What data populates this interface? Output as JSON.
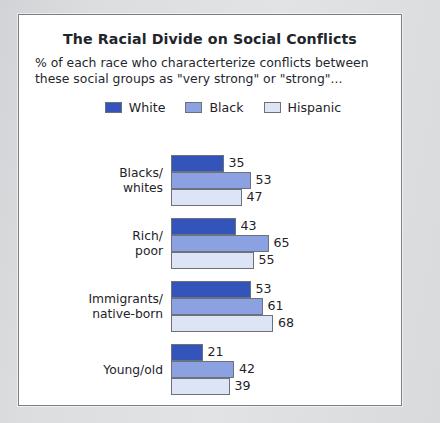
{
  "chart_data": {
    "type": "bar",
    "orientation": "horizontal",
    "title": "The Racial Divide on Social Conflicts",
    "subtitle": "% of each race who characterterize conflicts between these social groups as \"very strong\" or \"strong\"...",
    "xlabel": "",
    "ylabel": "",
    "xlim": [
      0,
      70
    ],
    "grid": false,
    "legend_position": "top-center",
    "categories": [
      "Blacks/\nwhites",
      "Rich/\npoor",
      "Immigrants/\nnative-born",
      "Young/old"
    ],
    "series": [
      {
        "name": "White",
        "color": "#3355bb",
        "values": [
          35,
          43,
          53,
          21
        ]
      },
      {
        "name": "Black",
        "color": "#8ba1e2",
        "values": [
          53,
          65,
          61,
          42
        ]
      },
      {
        "name": "Hispanic",
        "color": "#dde4f5",
        "values": [
          47,
          55,
          68,
          39
        ]
      }
    ]
  },
  "legend": {
    "items": [
      {
        "label": "White",
        "color": "#3355bb"
      },
      {
        "label": "Black",
        "color": "#8ba1e2"
      },
      {
        "label": "Hispanic",
        "color": "#dde4f5"
      }
    ]
  },
  "groups": [
    {
      "label": "Blacks/\nwhites",
      "bars": [
        {
          "series": "White",
          "value": 35,
          "value_text": "35",
          "color": "#3355bb"
        },
        {
          "series": "Black",
          "value": 53,
          "value_text": "53",
          "color": "#8ba1e2"
        },
        {
          "series": "Hispanic",
          "value": 47,
          "value_text": "47",
          "color": "#dde4f5"
        }
      ]
    },
    {
      "label": "Rich/\npoor",
      "bars": [
        {
          "series": "White",
          "value": 43,
          "value_text": "43",
          "color": "#3355bb"
        },
        {
          "series": "Black",
          "value": 65,
          "value_text": "65",
          "color": "#8ba1e2"
        },
        {
          "series": "Hispanic",
          "value": 55,
          "value_text": "55",
          "color": "#dde4f5"
        }
      ]
    },
    {
      "label": "Immigrants/\nnative-born",
      "bars": [
        {
          "series": "White",
          "value": 53,
          "value_text": "53",
          "color": "#3355bb"
        },
        {
          "series": "Black",
          "value": 61,
          "value_text": "61",
          "color": "#8ba1e2"
        },
        {
          "series": "Hispanic",
          "value": 68,
          "value_text": "68",
          "color": "#dde4f5"
        }
      ]
    },
    {
      "label": "Young/old",
      "bars": [
        {
          "series": "White",
          "value": 21,
          "value_text": "21",
          "color": "#3355bb"
        },
        {
          "series": "Black",
          "value": 42,
          "value_text": "42",
          "color": "#8ba1e2"
        },
        {
          "series": "Hispanic",
          "value": 39,
          "value_text": "39",
          "color": "#dde4f5"
        }
      ]
    }
  ],
  "scale": {
    "px_per_unit": 1.5
  }
}
